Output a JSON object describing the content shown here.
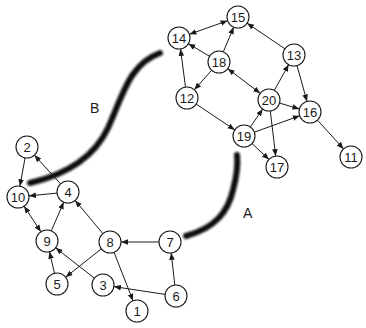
{
  "diagram": {
    "type": "directed-graph",
    "colors": {
      "node_stroke": "#1a1a1a",
      "node_fill": "#ffffff",
      "edge": "#1a1a1a",
      "cut_stroke": "#111111"
    },
    "node_radius": 11,
    "nodes": [
      {
        "id": "1",
        "label": "1",
        "x": 137,
        "y": 311
      },
      {
        "id": "2",
        "label": "2",
        "x": 27,
        "y": 147
      },
      {
        "id": "3",
        "label": "3",
        "x": 103,
        "y": 285
      },
      {
        "id": "4",
        "label": "4",
        "x": 68,
        "y": 192
      },
      {
        "id": "5",
        "label": "5",
        "x": 57,
        "y": 284
      },
      {
        "id": "6",
        "label": "6",
        "x": 176,
        "y": 296
      },
      {
        "id": "7",
        "label": "7",
        "x": 170,
        "y": 242
      },
      {
        "id": "8",
        "label": "8",
        "x": 110,
        "y": 242
      },
      {
        "id": "9",
        "label": "9",
        "x": 47,
        "y": 241
      },
      {
        "id": "10",
        "label": "10",
        "x": 18,
        "y": 197
      },
      {
        "id": "11",
        "label": "11",
        "x": 351,
        "y": 157
      },
      {
        "id": "12",
        "label": "12",
        "x": 187,
        "y": 98
      },
      {
        "id": "13",
        "label": "13",
        "x": 294,
        "y": 55
      },
      {
        "id": "14",
        "label": "14",
        "x": 179,
        "y": 38
      },
      {
        "id": "15",
        "label": "15",
        "x": 238,
        "y": 17
      },
      {
        "id": "16",
        "label": "16",
        "x": 310,
        "y": 112
      },
      {
        "id": "17",
        "label": "17",
        "x": 277,
        "y": 167
      },
      {
        "id": "18",
        "label": "18",
        "x": 219,
        "y": 62
      },
      {
        "id": "19",
        "label": "19",
        "x": 244,
        "y": 136
      },
      {
        "id": "20",
        "label": "20",
        "x": 269,
        "y": 100
      }
    ],
    "edges": [
      {
        "from": "2",
        "to": "10",
        "bidirectional": false
      },
      {
        "from": "4",
        "to": "2",
        "bidirectional": false
      },
      {
        "from": "4",
        "to": "10",
        "bidirectional": false
      },
      {
        "from": "10",
        "to": "9",
        "bidirectional": true
      },
      {
        "from": "9",
        "to": "4",
        "bidirectional": false
      },
      {
        "from": "8",
        "to": "4",
        "bidirectional": false
      },
      {
        "from": "5",
        "to": "9",
        "bidirectional": false
      },
      {
        "from": "3",
        "to": "9",
        "bidirectional": false
      },
      {
        "from": "8",
        "to": "5",
        "bidirectional": false
      },
      {
        "from": "8",
        "to": "1",
        "bidirectional": false
      },
      {
        "from": "7",
        "to": "8",
        "bidirectional": false
      },
      {
        "from": "6",
        "to": "7",
        "bidirectional": false
      },
      {
        "from": "6",
        "to": "3",
        "bidirectional": false
      },
      {
        "from": "14",
        "to": "15",
        "bidirectional": true
      },
      {
        "from": "18",
        "to": "14",
        "bidirectional": false
      },
      {
        "from": "18",
        "to": "15",
        "bidirectional": false
      },
      {
        "from": "18",
        "to": "12",
        "bidirectional": false
      },
      {
        "from": "12",
        "to": "14",
        "bidirectional": false
      },
      {
        "from": "18",
        "to": "20",
        "bidirectional": true
      },
      {
        "from": "13",
        "to": "15",
        "bidirectional": false
      },
      {
        "from": "13",
        "to": "16",
        "bidirectional": false
      },
      {
        "from": "20",
        "to": "13",
        "bidirectional": false
      },
      {
        "from": "20",
        "to": "16",
        "bidirectional": false
      },
      {
        "from": "20",
        "to": "17",
        "bidirectional": false
      },
      {
        "from": "12",
        "to": "19",
        "bidirectional": false
      },
      {
        "from": "19",
        "to": "20",
        "bidirectional": false
      },
      {
        "from": "19",
        "to": "16",
        "bidirectional": false
      },
      {
        "from": "19",
        "to": "17",
        "bidirectional": false
      },
      {
        "from": "16",
        "to": "11",
        "bidirectional": false
      }
    ],
    "cuts": [
      {
        "label": "A",
        "path": "M186,236 C215,228 228,212 233,190 C237,175 238,164 237,155",
        "label_x": 243,
        "label_y": 218
      },
      {
        "label": "B",
        "path": "M30,183 C60,176 92,162 108,128 C124,92 130,64 160,53",
        "label_x": 90,
        "label_y": 113
      }
    ]
  }
}
